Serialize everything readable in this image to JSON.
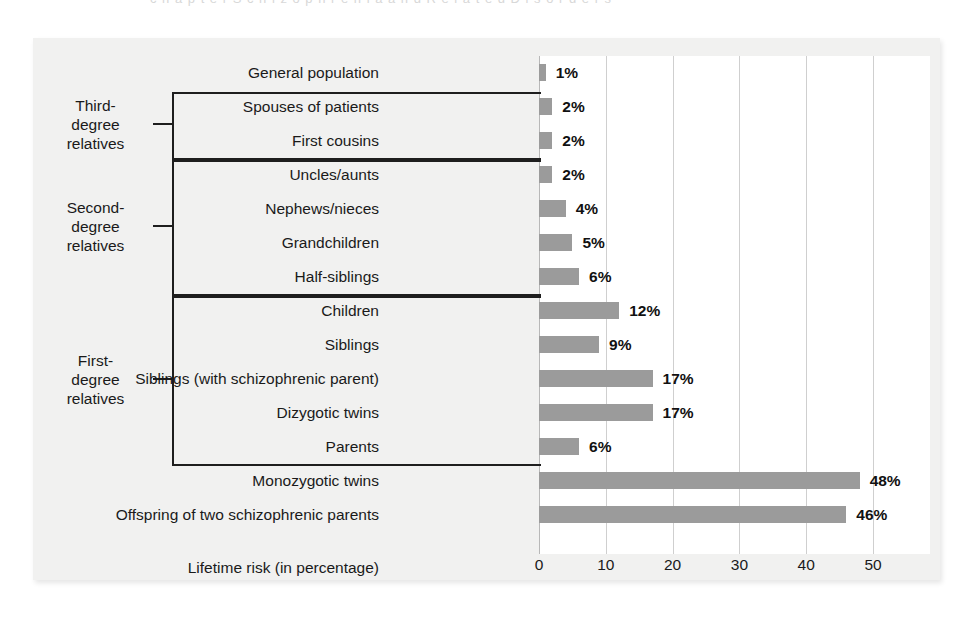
{
  "page": {
    "ghost_top_text": "c h a p t e r   S c h i z o p h r e n i a   a n d   R e l a t e d   D i s o r d e r s",
    "background_color": "#ffffff",
    "panel_color": "#f1f1f0"
  },
  "chart_data": {
    "type": "bar",
    "orientation": "horizontal",
    "title": "",
    "subtitle": "",
    "xlabel": "Lifetime risk (in percentage)",
    "ylabel": "",
    "xlim": [
      0,
      58.5
    ],
    "xticks": [
      0,
      10,
      20,
      30,
      40,
      50
    ],
    "xtick_labels": [
      "0",
      "10",
      "20",
      "30",
      "40",
      "50"
    ],
    "grid": true,
    "grid_axis": "x",
    "legend": "none",
    "bar_color": "#9b9b9b",
    "value_suffix": "%",
    "categories": [
      "General population",
      "Spouses of patients",
      "First cousins",
      "Uncles/aunts",
      "Nephews/nieces",
      "Grandchildren",
      "Half-siblings",
      "Children",
      "Siblings",
      "Siblings (with schizophrenic parent)",
      "Dizygotic twins",
      "Parents",
      "Monozygotic twins",
      "Offspring of two schizophrenic parents"
    ],
    "values": [
      1,
      2,
      2,
      2,
      4,
      5,
      6,
      12,
      9,
      17,
      17,
      6,
      48,
      46
    ],
    "value_labels": [
      "1%",
      "2%",
      "2%",
      "2%",
      "4%",
      "5%",
      "6%",
      "12%",
      "9%",
      "17%",
      "17%",
      "6%",
      "48%",
      "46%"
    ],
    "groups": [
      {
        "label": "Third-degree relatives",
        "label_lines": [
          "Third-",
          "degree",
          "relatives"
        ],
        "members": [
          "Spouses of patients",
          "First cousins"
        ]
      },
      {
        "label": "Second-degree relatives",
        "label_lines": [
          "Second-",
          "degree",
          "relatives"
        ],
        "members": [
          "Uncles/aunts",
          "Nephews/nieces",
          "Grandchildren",
          "Half-siblings"
        ]
      },
      {
        "label": "First-degree relatives",
        "label_lines": [
          "First-",
          "degree",
          "relatives"
        ],
        "members": [
          "Children",
          "Siblings",
          "Siblings (with schizophrenic parent)",
          "Dizygotic twins",
          "Parents"
        ]
      }
    ]
  }
}
